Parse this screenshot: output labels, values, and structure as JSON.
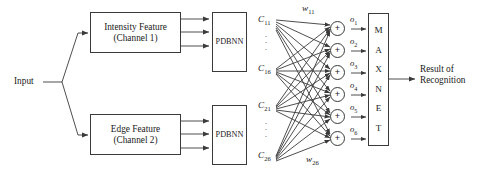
{
  "diagram": {
    "background_color": "#ffffff",
    "stroke_color": "#3a3a3a",
    "text_color": "#1a1a1a"
  },
  "input": {
    "label": "Input"
  },
  "feature_blocks": [
    {
      "id": "intensity",
      "line1": "Intensity Feature",
      "line2": "(Channel 1)"
    },
    {
      "id": "edge",
      "line1": "Edge Feature",
      "line2": "(Channel 2)"
    }
  ],
  "classifiers": [
    {
      "id": "pdbnn-top",
      "label": "PDBNN"
    },
    {
      "id": "pdbnn-bottom",
      "label": "PDBNN"
    }
  ],
  "class_nodes": [
    {
      "id": "c11",
      "base": "C",
      "sub": "11"
    },
    {
      "id": "c16",
      "base": "C",
      "sub": "16"
    },
    {
      "id": "c21",
      "base": "C",
      "sub": "21"
    },
    {
      "id": "c26",
      "base": "C",
      "sub": "26"
    }
  ],
  "ellipsis": {
    "glyph": "·",
    "count": 3
  },
  "weights": [
    {
      "id": "w11",
      "base": "w",
      "sub": "11"
    },
    {
      "id": "w26",
      "base": "w",
      "sub": "26"
    }
  ],
  "summation_units": [
    {
      "symbol": "+",
      "output_base": "o",
      "output_sub": "1"
    },
    {
      "symbol": "+",
      "output_base": "o",
      "output_sub": "2"
    },
    {
      "symbol": "+",
      "output_base": "o",
      "output_sub": "3"
    },
    {
      "symbol": "+",
      "output_base": "o",
      "output_sub": "4"
    },
    {
      "symbol": "+",
      "output_base": "o",
      "output_sub": "5"
    },
    {
      "symbol": "+",
      "output_base": "o",
      "output_sub": "6"
    }
  ],
  "maxnet": {
    "letters": [
      "M",
      "A",
      "X",
      "N",
      "E",
      "T"
    ],
    "name": "MAXNET"
  },
  "result": {
    "line1": "Result of",
    "line2": "Recognition"
  }
}
